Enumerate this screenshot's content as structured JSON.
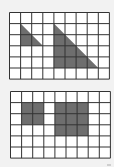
{
  "diagram": {
    "background": "#f2f2f2",
    "grid_color": "#333333",
    "fill_color": "#6e6e6e",
    "panels": [
      {
        "name": "triangles-grid",
        "x": 9,
        "y": 12,
        "cols": 9,
        "rows": 6,
        "cell": 11.1,
        "shapes": [
          {
            "type": "triangle",
            "points": [
              [
                1,
                1
              ],
              [
                1,
                3
              ],
              [
                3,
                3
              ]
            ]
          },
          {
            "type": "triangle",
            "points": [
              [
                4,
                1
              ],
              [
                4,
                5
              ],
              [
                8,
                5
              ]
            ]
          }
        ]
      },
      {
        "name": "squares-grid",
        "x": 10,
        "y": 91,
        "cols": 9,
        "rows": 6,
        "cell": 11.1,
        "shapes": [
          {
            "type": "square",
            "points": [
              [
                1,
                1
              ],
              [
                3,
                1
              ],
              [
                3,
                3
              ],
              [
                1,
                3
              ]
            ]
          },
          {
            "type": "square",
            "points": [
              [
                4,
                1
              ],
              [
                7,
                1
              ],
              [
                7,
                4
              ],
              [
                4,
                4
              ]
            ]
          }
        ]
      }
    ]
  }
}
